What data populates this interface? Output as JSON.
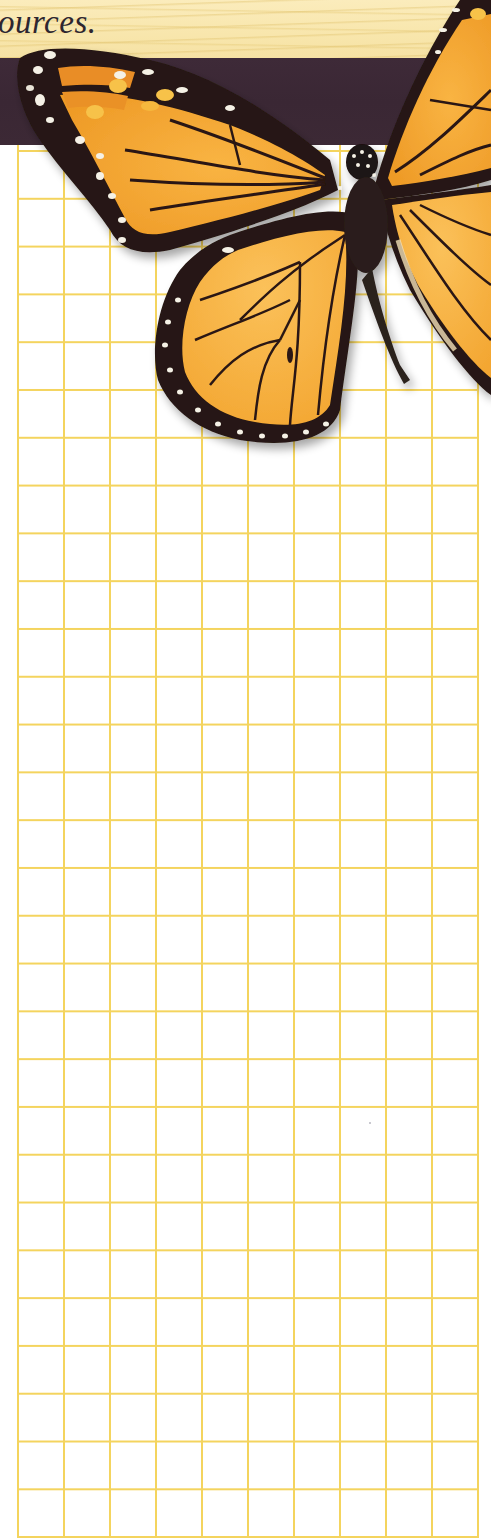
{
  "header": {
    "headline_fragment": "ources."
  },
  "colors": {
    "wood_light": "#fbecbc",
    "band_purple": "#3c2935",
    "grid_line": "#f4d45e",
    "paper": "#ffffff",
    "wing_orange": "#f5a832",
    "wing_black": "#2a1a14"
  },
  "grid": {
    "columns": 10,
    "rows": 29,
    "cell_width_px": 46,
    "cell_height_px": 48
  },
  "illustration": {
    "subject": "monarch-butterfly"
  }
}
